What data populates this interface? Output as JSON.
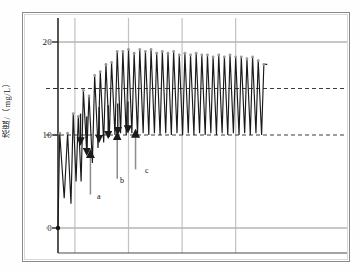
{
  "figure": {
    "y_axis_title": "浓度/（mg/L）",
    "tick_labels": [
      "20",
      "10",
      "0"
    ],
    "annotations": [
      "a",
      "b",
      "c"
    ]
  },
  "chart_data": {
    "type": "line",
    "title": "",
    "xlabel": "",
    "ylabel": "浓度/（mg/L）",
    "ylim": [
      0,
      22
    ],
    "xlim": [
      0,
      100
    ],
    "yticks": [
      0,
      10,
      20
    ],
    "ytick_labels": [
      "0",
      "10",
      "20"
    ],
    "minor_yticks": [
      15
    ],
    "grid": {
      "horizontal_solid": [
        0,
        20
      ],
      "horizontal_dashed": [
        10,
        15
      ],
      "vertical_gridlines_x": [
        6,
        25,
        44,
        63
      ],
      "legend": "none"
    },
    "annotations": [
      {
        "label": "a",
        "type": "up-arrow",
        "x": 11.5,
        "y_tip": 8.0,
        "y_base": 3.6
      },
      {
        "label": "b",
        "type": "up-arrow",
        "x": 21.0,
        "y_tip": 9.9,
        "y_base": 5.3
      },
      {
        "label": "c",
        "type": "up-arrow",
        "x": 27.5,
        "y_tip": 10.2,
        "y_base": 6.3
      },
      {
        "label": "",
        "type": "down-arrow",
        "x": 8.0,
        "y_base": 12.3,
        "y_tip": 9.3
      },
      {
        "label": "",
        "type": "down-arrow",
        "x": 10.2,
        "y_base": 12.0,
        "y_tip": 8.2
      },
      {
        "label": "",
        "type": "down-arrow",
        "x": 14.6,
        "y_base": 13.0,
        "y_tip": 9.6
      },
      {
        "label": "",
        "type": "down-arrow",
        "x": 17.8,
        "y_base": 13.2,
        "y_tip": 10.0
      },
      {
        "label": "",
        "type": "down-arrow",
        "x": 21.2,
        "y_base": 13.4,
        "y_tip": 10.4
      },
      {
        "label": "",
        "type": "down-arrow",
        "x": 24.8,
        "y_base": 13.6,
        "y_tip": 10.6
      }
    ],
    "series": [
      {
        "name": "concentration",
        "marker": "dot-at-origin",
        "x": [
          0,
          0.6,
          2.2,
          3.4,
          4.6,
          5.4,
          6.4,
          7.2,
          8.2,
          9.0,
          10.2,
          11.0,
          12.2,
          13.0,
          14.2,
          15.0,
          16.2,
          17.0,
          18.2,
          19.0,
          20.2,
          21.0,
          22.2,
          23.0,
          24.2,
          25.0,
          26.2,
          27.0,
          28.2,
          29.0,
          30.2,
          31.0,
          32.2,
          33.0,
          34.2,
          35.0,
          36.2,
          37.0,
          38.2,
          39.0,
          40.2,
          41.0,
          42.2,
          43.0,
          44.2,
          45.0,
          46.2,
          47.0,
          48.2,
          49.0,
          50.2,
          51.0,
          52.2,
          53.0,
          54.2,
          55.0,
          56.2,
          57.0,
          58.2,
          59.0,
          60.2,
          61.0,
          62.2,
          63.0,
          64.2,
          65.0,
          66.2,
          67.0,
          68.2,
          69.0,
          70.2,
          71.0,
          72.2,
          73.0,
          74.2
        ],
        "y": [
          0,
          10.2,
          3.2,
          10.2,
          2.6,
          12.3,
          5.0,
          12.0,
          5.0,
          14.8,
          8.0,
          14.2,
          7.0,
          16.4,
          8.6,
          16.8,
          9.2,
          17.6,
          9.8,
          17.8,
          10.0,
          19.0,
          10.2,
          19.0,
          10.0,
          19.2,
          10.2,
          18.8,
          10.0,
          19.2,
          10.2,
          19.0,
          10.0,
          19.2,
          10.2,
          18.8,
          10.0,
          19.0,
          10.2,
          18.8,
          10.0,
          19.0,
          10.2,
          18.6,
          10.0,
          18.8,
          10.2,
          18.6,
          10.0,
          18.8,
          10.2,
          18.6,
          10.0,
          18.6,
          10.2,
          18.4,
          10.0,
          18.6,
          10.2,
          18.4,
          10.0,
          18.6,
          10.2,
          18.4,
          10.0,
          18.4,
          10.2,
          18.2,
          10.0,
          18.4,
          10.2,
          18.0,
          10.0,
          17.6,
          17.6
        ]
      }
    ]
  }
}
